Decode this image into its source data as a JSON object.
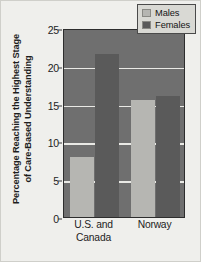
{
  "chart_data": {
    "type": "bar",
    "title": "",
    "xlabel": "",
    "ylabel": "Percentage Reaching the Highest Stage of Care-Based Understanding",
    "ylabel_line1": "Percentage Reaching the Highest Stage",
    "ylabel_line2": "of Care-Based Understanding",
    "categories": [
      "U.S. and Canada",
      "Norway"
    ],
    "category_lines": [
      [
        "U.S. and",
        "Canada"
      ],
      [
        "Norway"
      ]
    ],
    "series": [
      {
        "name": "Males",
        "values": [
          8,
          15.5
        ],
        "color": "#b6b6b2"
      },
      {
        "name": "Females",
        "values": [
          21.5,
          16
        ],
        "color": "#5a5a5a"
      }
    ],
    "ylim": [
      0,
      25
    ],
    "yticks": [
      0,
      5,
      10,
      15,
      20,
      25
    ],
    "ytick_labels": [
      "0",
      "5",
      "10",
      "15",
      "20",
      "25"
    ],
    "grid": true,
    "grid_color": "#f2f2ee",
    "legend_position": "top-right",
    "plot_background": "#6f6f6f",
    "figure_background": "#efefec"
  },
  "legend": {
    "entries": [
      {
        "label": "Males"
      },
      {
        "label": "Females"
      }
    ]
  }
}
